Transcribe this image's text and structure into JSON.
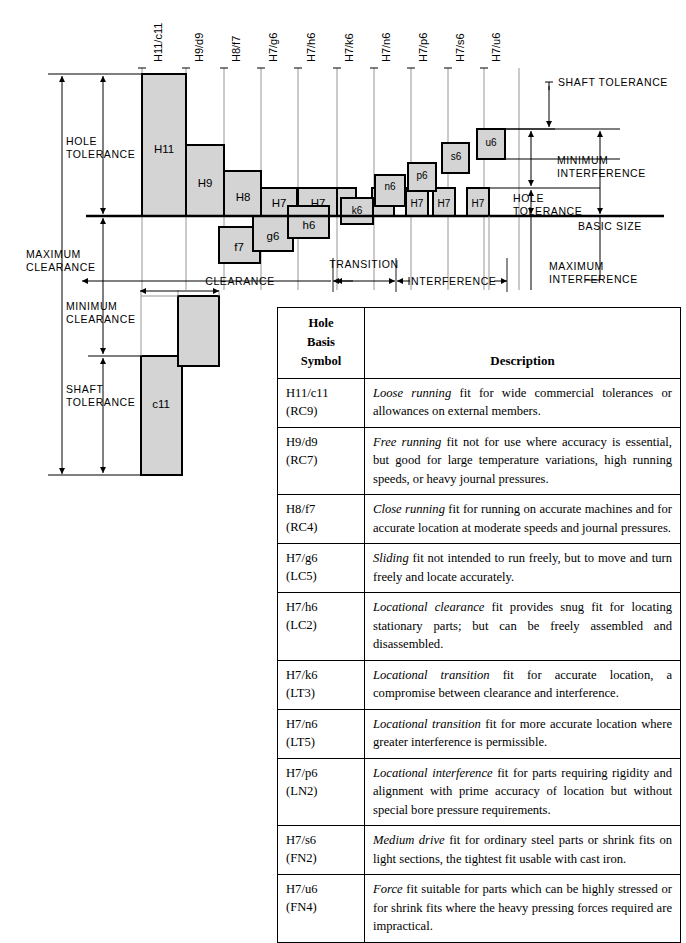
{
  "diagram": {
    "basic_size_label": "BASIC SIZE",
    "annotations": {
      "hole_tolerance_left": "HOLE\nTOLERANCE",
      "hole_tolerance_left_l1": "HOLE",
      "hole_tolerance_left_l2": "TOLERANCE",
      "maximum_clearance_l1": "MAXIMUM",
      "maximum_clearance_l2": "CLEARANCE",
      "minimum_clearance_l1": "MINIMUM",
      "minimum_clearance_l2": "CLEARANCE",
      "shaft_tolerance_left_l1": "SHAFT",
      "shaft_tolerance_left_l2": "TOLERANCE",
      "shaft_tolerance_right": "SHAFT TOLERANCE",
      "minimum_interference_l1": "MINIMUM",
      "minimum_interference_l2": "INTERFERENCE",
      "hole_tolerance_right_l1": "HOLE",
      "hole_tolerance_right_l2": "TOLERANCE",
      "maximum_interference_l1": "MAXIMUM",
      "maximum_interference_l2": "INTERFERENCE",
      "clearance_band": "CLEARANCE",
      "transition_band": "TRANSITION",
      "interference_band": "INTERFERENCE"
    },
    "column_labels": [
      "H11/c11",
      "H9/d9",
      "H8/f7",
      "H7/g6",
      "H7/h6",
      "H7/k6",
      "H7/n6",
      "H7/p6",
      "H7/s6",
      "H7/u6"
    ],
    "hole_bars": [
      {
        "label": "H11",
        "x": 142,
        "width": 44,
        "top": 74
      },
      {
        "label": "H9",
        "x": 186,
        "width": 38,
        "top": 145
      },
      {
        "label": "H8",
        "x": 224,
        "width": 37,
        "top": 171
      },
      {
        "label": "H7",
        "x": 261,
        "width": 36,
        "top": 188
      },
      {
        "label": "H7",
        "x": 298,
        "width": 39,
        "top": 188
      },
      {
        "label": "H7",
        "x": 337,
        "width": 19,
        "top": 188
      },
      {
        "label": "H7",
        "x": 363,
        "width": 19,
        "top": 188
      },
      {
        "label": "H7",
        "x": 394,
        "width": 19,
        "top": 188
      },
      {
        "label": "H7",
        "x": 428,
        "width": 20,
        "top": 188
      },
      {
        "label": "H7",
        "x": 462,
        "width": 20,
        "top": 188
      }
    ],
    "shaft_bars": [
      {
        "label": "f7",
        "x": 219,
        "width": 41,
        "top": 227,
        "bottom": 262
      },
      {
        "label": "g6",
        "x": 253,
        "width": 40,
        "top": 216,
        "bottom": 251
      },
      {
        "label": "h6",
        "x": 288,
        "width": 41,
        "top": 206,
        "bottom": 238
      },
      {
        "label": "k6",
        "x": 341,
        "width": 32,
        "top": 198,
        "bottom": 224
      },
      {
        "label": "n6",
        "x": 375,
        "width": 30,
        "top": 175,
        "bottom": 206
      },
      {
        "label": "p6",
        "x": 408,
        "width": 28,
        "top": 163,
        "bottom": 191
      },
      {
        "label": "s6",
        "x": 442,
        "width": 27,
        "top": 143,
        "bottom": 173
      },
      {
        "label": "u6",
        "x": 477,
        "width": 28,
        "top": 129,
        "bottom": 159
      },
      {
        "label": "c11",
        "x": 141,
        "width": 41,
        "top": 356,
        "bottom": 475
      },
      {
        "label": "",
        "x": 178,
        "width": 41,
        "top": 296,
        "bottom": 366
      }
    ],
    "colors": {
      "bar_fill": "#d4d4d4",
      "bar_stroke": "#000000",
      "rule": "#000000",
      "guide": "#9a9a9a"
    }
  },
  "table": {
    "header": {
      "symbol_l1": "Hole",
      "symbol_l2": "Basis",
      "symbol_l3": "Symbol",
      "description": "Description"
    },
    "rows": [
      {
        "symbol_l1": "H11/c11",
        "symbol_l2": "(RC9)",
        "term": "Loose running",
        "description": " fit for wide commercial toler­ances or allowances on external members."
      },
      {
        "symbol_l1": "H9/d9",
        "symbol_l2": "(RC7)",
        "term": "Free running",
        "description": " fit not for use where accuracy is essential, but good for large temperature varia­tions, high running speeds, or heavy journal pressures."
      },
      {
        "symbol_l1": "H8/f7",
        "symbol_l2": "(RC4)",
        "term": "Close running",
        "description": " fit for running on accurate machines and for accurate location at moder­ate speeds and journal pressures."
      },
      {
        "symbol_l1": "H7/g6",
        "symbol_l2": "(LC5)",
        "term": "Sliding",
        "description": " fit not intended to run freely, but to move and turn freely and locate accurately."
      },
      {
        "symbol_l1": "H7/h6",
        "symbol_l2": "(LC2)",
        "term": "Locational clearance",
        "description": " fit provides snug fit for locating stationary parts; but can be freely assembled and disassembled."
      },
      {
        "symbol_l1": "H7/k6",
        "symbol_l2": "(LT3)",
        "term": "Locational transition",
        "description": " fit for accurate location, a compromise between clearance and inter­ference."
      },
      {
        "symbol_l1": "H7/n6",
        "symbol_l2": "(LT5)",
        "term": "Locational transition",
        "description": " fit for more accurate location where greater interference is per­missible."
      },
      {
        "symbol_l1": "H7/p6",
        "symbol_l2": "(LN2)",
        "term": "Locational interference",
        "description": " fit for parts requiring rigidity and alignment with prime accuracy of location but without special bore pressure requirements."
      },
      {
        "symbol_l1": "H7/s6",
        "symbol_l2": "(FN2)",
        "term": "Medium drive",
        "description": " fit for ordinary steel parts or shrink fits on light sections, the tightest fit usable with cast iron."
      },
      {
        "symbol_l1": "H7/u6",
        "symbol_l2": "(FN4)",
        "term": "Force",
        "description": " fit suitable for parts which can be high­ly stressed or for shrink fits where the heavy pressing forces required are impractical."
      }
    ]
  }
}
